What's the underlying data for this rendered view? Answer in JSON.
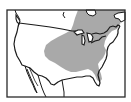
{
  "map": {
    "type": "range-map",
    "region": "North America (United States and southern Canada)",
    "colors": {
      "background": "#ffffff",
      "range_fill": "#a9a9a9",
      "outline": "#1a1a1a",
      "frame": "#2a2a2a"
    },
    "legend": [],
    "labels": [],
    "shaded_range": "eastern and central United States and southeastern Canada"
  }
}
